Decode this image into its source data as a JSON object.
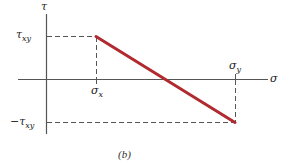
{
  "figure": {
    "caption": "(b)",
    "colors": {
      "axis": "#555555",
      "dash": "#555555",
      "line": "#b02a30",
      "text": "#222222"
    },
    "axes": {
      "vertical_label": "τ",
      "horizontal_label": "σ"
    },
    "labels": {
      "tau_xy": {
        "symbol": "τ",
        "sub": "xy"
      },
      "neg_tau_xy": {
        "symbol": "−τ",
        "sub": "xy"
      },
      "sigma_x": {
        "symbol": "σ",
        "sub": "x"
      },
      "sigma_y": {
        "symbol": "σ",
        "sub": "y"
      }
    },
    "line": {
      "description": "Straight line from (σx, τxy) to (σy, −τxy)",
      "start": [
        "σx",
        "τxy"
      ],
      "end": [
        "σy",
        "−τxy"
      ]
    }
  }
}
